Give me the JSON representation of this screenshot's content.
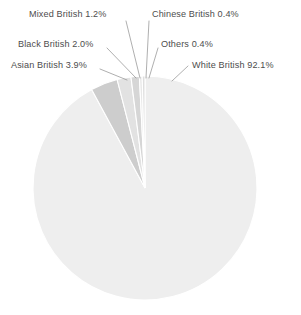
{
  "chart_data": {
    "type": "pie",
    "title": "",
    "subtitle": "",
    "xlabel": "",
    "ylabel": "",
    "legend_position": "none",
    "grid": false,
    "labels_show_percent": true,
    "categories": [
      "White British",
      "Asian British",
      "Black British",
      "Mixed British",
      "Chinese British",
      "Others"
    ],
    "values": [
      92.1,
      3.9,
      2.0,
      1.2,
      0.4,
      0.4
    ],
    "value_suffix": "%",
    "slices": [
      {
        "name": "White British",
        "value": 92.1,
        "label": "White British 92.1%",
        "color": "#eeeeee"
      },
      {
        "name": "Asian British",
        "value": 3.9,
        "label": "Asian British 3.9%",
        "color": "#cdcdcd"
      },
      {
        "name": "Black British",
        "value": 2.0,
        "label": "Black British 2.0%",
        "color": "#e2e2e2"
      },
      {
        "name": "Mixed British",
        "value": 1.2,
        "label": "Mixed British 1.2%",
        "color": "#d6d6d6"
      },
      {
        "name": "Chinese British",
        "value": 0.4,
        "label": "Chinese British 0.4%",
        "color": "#e8e8e8"
      },
      {
        "name": "Others",
        "value": 0.4,
        "label": "Others 0.4%",
        "color": "#dedede"
      }
    ]
  },
  "style": {
    "background": "#ffffff",
    "text_color": "#4d4d4d",
    "leader_line_color": "#8d8d8d",
    "slice_border_color": "#ffffff"
  },
  "geometry": {
    "center_x": 145,
    "center_y": 188,
    "radius": 112,
    "start_angle_deg": 0
  }
}
